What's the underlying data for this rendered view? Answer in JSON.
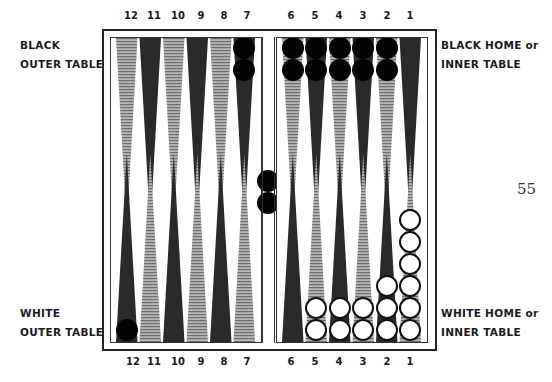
{
  "labels": {
    "black_outer": [
      "BLACK",
      "OUTER TABLE"
    ],
    "black_home": [
      "BLACK HOME or",
      "INNER TABLE"
    ],
    "white_outer": [
      "WHITE",
      "OUTER TABLE"
    ],
    "white_home": [
      "WHITE HOME or",
      "INNER TABLE"
    ]
  },
  "page_number": "55",
  "point_numbers": {
    "left": [
      "12",
      "11",
      "10",
      "9",
      "8",
      "7"
    ],
    "right": [
      "6",
      "5",
      "4",
      "3",
      "2",
      "1"
    ]
  },
  "colors": {
    "dark_point": "#2a2a2a",
    "light_point": "#9a9a9a",
    "black_checker": "#050505",
    "white_checker": "#ffffff"
  },
  "board": {
    "top_points": [
      {
        "point": "12",
        "shade": "light",
        "checkers": 0
      },
      {
        "point": "11",
        "shade": "dark",
        "checkers": 0
      },
      {
        "point": "10",
        "shade": "light",
        "checkers": 0
      },
      {
        "point": "9",
        "shade": "dark",
        "checkers": 0
      },
      {
        "point": "8",
        "shade": "light",
        "checkers": 0
      },
      {
        "point": "7",
        "shade": "dark",
        "checkers": 2,
        "color": "black"
      },
      {
        "point": "6",
        "shade": "light",
        "checkers": 2,
        "color": "black"
      },
      {
        "point": "5",
        "shade": "dark",
        "checkers": 2,
        "color": "black"
      },
      {
        "point": "4",
        "shade": "light",
        "checkers": 2,
        "color": "black"
      },
      {
        "point": "3",
        "shade": "dark",
        "checkers": 2,
        "color": "black"
      },
      {
        "point": "2",
        "shade": "light",
        "checkers": 2,
        "color": "black"
      },
      {
        "point": "1",
        "shade": "dark",
        "checkers": 0
      }
    ],
    "bottom_points": [
      {
        "point": "12",
        "shade": "dark",
        "checkers": 1,
        "color": "black"
      },
      {
        "point": "11",
        "shade": "light",
        "checkers": 0
      },
      {
        "point": "10",
        "shade": "dark",
        "checkers": 0
      },
      {
        "point": "9",
        "shade": "light",
        "checkers": 0
      },
      {
        "point": "8",
        "shade": "dark",
        "checkers": 0
      },
      {
        "point": "7",
        "shade": "light",
        "checkers": 0
      },
      {
        "point": "6",
        "shade": "dark",
        "checkers": 0
      },
      {
        "point": "5",
        "shade": "light",
        "checkers": 2,
        "color": "white"
      },
      {
        "point": "4",
        "shade": "dark",
        "checkers": 2,
        "color": "white"
      },
      {
        "point": "3",
        "shade": "light",
        "checkers": 2,
        "color": "white"
      },
      {
        "point": "2",
        "shade": "dark",
        "checkers": 3,
        "color": "white"
      },
      {
        "point": "1",
        "shade": "light",
        "checkers": 6,
        "color": "white"
      }
    ],
    "bar": {
      "black": 2,
      "white": 0
    }
  }
}
